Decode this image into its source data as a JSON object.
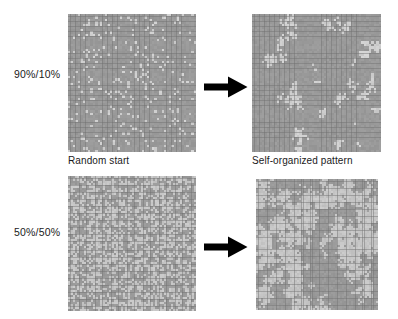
{
  "figure": {
    "title_visible": false,
    "background_color": "#ffffff",
    "row_labels": [
      {
        "id": "ratio-90-10",
        "text": "90%/10%",
        "x": 14,
        "y": 68
      },
      {
        "id": "ratio-50-50",
        "text": "50%/50%",
        "x": 14,
        "y": 226
      }
    ],
    "column_captions": [
      {
        "id": "random-start",
        "text": "Random start",
        "x": 68,
        "y": 155
      },
      {
        "id": "self-organized-pattern",
        "text": "Self-organized pattern",
        "x": 252,
        "y": 155
      }
    ],
    "arrows": [
      {
        "id": "arrow-top",
        "name": "arrow-right-icon",
        "x": 204,
        "y": 76,
        "width": 44,
        "height": 22,
        "color": "#000000"
      },
      {
        "id": "arrow-bottom",
        "name": "arrow-right-icon",
        "x": 204,
        "y": 236,
        "width": 44,
        "height": 22,
        "color": "#000000"
      }
    ],
    "panels": [
      {
        "id": "panel-90-10-random",
        "name": "grid-90-10-random-start",
        "row": "90%/10%",
        "column": "Random start",
        "x": 68,
        "y": 14,
        "width": 128,
        "height": 138,
        "cols": 52,
        "rows": 56,
        "minority_fraction": 0.1,
        "arrangement": "random",
        "colors": {
          "background": "#9a9a9a",
          "majority": "#9a9a9a",
          "minority": "#cfcfcf",
          "gridline": "#8e8e8e"
        }
      },
      {
        "id": "panel-90-10-organized",
        "name": "grid-90-10-self-organized",
        "row": "90%/10%",
        "column": "Self-organized pattern",
        "x": 252,
        "y": 14,
        "width": 129,
        "height": 138,
        "cols": 52,
        "rows": 56,
        "minority_fraction": 0.1,
        "arrangement": "clustered",
        "colors": {
          "background": "#9a9a9a",
          "majority": "#9a9a9a",
          "minority": "#cfcfcf",
          "gridline": "#8e8e8e"
        }
      },
      {
        "id": "panel-50-50-random",
        "name": "grid-50-50-random-start",
        "row": "50%/50%",
        "column": "Random start",
        "x": 68,
        "y": 176,
        "width": 128,
        "height": 135,
        "cols": 56,
        "rows": 58,
        "minority_fraction": 0.5,
        "arrangement": "random",
        "colors": {
          "background": "#9a9a9a",
          "majority": "#9a9a9a",
          "minority": "#c6c6c6",
          "gridline": "#8e8e8e"
        }
      },
      {
        "id": "panel-50-50-organized",
        "name": "grid-50-50-self-organized",
        "row": "50%/50%",
        "column": "Self-organized pattern",
        "x": 256,
        "y": 179,
        "width": 122,
        "height": 131,
        "cols": 54,
        "rows": 56,
        "minority_fraction": 0.5,
        "arrangement": "clustered",
        "colors": {
          "background": "#9a9a9a",
          "majority": "#9a9a9a",
          "minority": "#c6c6c6",
          "gridline": "#8e8e8e"
        }
      }
    ]
  }
}
